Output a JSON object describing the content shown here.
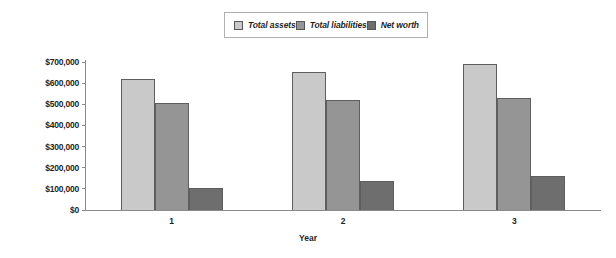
{
  "chart_data": {
    "type": "bar",
    "title": "",
    "xlabel": "Year",
    "ylabel": "",
    "categories": [
      "1",
      "2",
      "3"
    ],
    "series": [
      {
        "name": "Total assets",
        "values": [
          620000,
          655000,
          690000
        ],
        "color": "#c9c9c9"
      },
      {
        "name": "Total liabilities",
        "values": [
          508000,
          518000,
          528000
        ],
        "color": "#959595"
      },
      {
        "name": "Net worth",
        "values": [
          105000,
          135000,
          162000
        ],
        "color": "#6e6e6e"
      }
    ],
    "ylim": [
      0,
      700000
    ],
    "ytick_labels": [
      "$700,000",
      "$600,000",
      "$500,000",
      "$400,000",
      "$300,000",
      "$200,000",
      "$100,000",
      "$0"
    ],
    "ytick_values": [
      700000,
      600000,
      500000,
      400000,
      300000,
      200000,
      100000,
      0
    ],
    "grid": false,
    "legend_position": "top-center"
  },
  "legend": {
    "entries": [
      {
        "label": "Total assets"
      },
      {
        "label": "Total liabilities"
      },
      {
        "label": "Net worth"
      }
    ]
  },
  "axes": {
    "x_title": "Year"
  }
}
